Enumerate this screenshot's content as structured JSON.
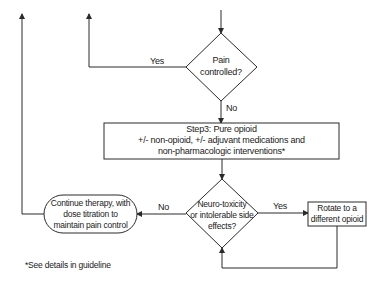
{
  "diagram": {
    "nodes": {
      "pain_controlled": {
        "type": "decision",
        "line1": "Pain",
        "line2": "controlled?"
      },
      "step3": {
        "type": "process",
        "line1": "Step3: Pure opioid",
        "line2": "+/- non-opioid, +/- adjuvant medications and",
        "line3": "non-pharmacologic interventions*"
      },
      "neurotoxicity": {
        "type": "decision",
        "line1": "Neuro-toxicity",
        "line2": "or intolerable side",
        "line3": "effects?"
      },
      "continue_therapy": {
        "type": "terminal",
        "line1": "Continue therapy, with",
        "line2": "dose titration to",
        "line3": "maintain pain control"
      },
      "rotate_opioid": {
        "type": "process",
        "line1": "Rotate to a",
        "line2": "different opioid"
      }
    },
    "edges": {
      "pain_yes": "Yes",
      "pain_no": "No",
      "neuro_yes": "Yes",
      "neuro_no": "No"
    },
    "footnote": "*See details in guideline",
    "colors": {
      "stroke": "#2a2a2a",
      "text": "#1a1a1a",
      "background": "#ffffff"
    }
  }
}
